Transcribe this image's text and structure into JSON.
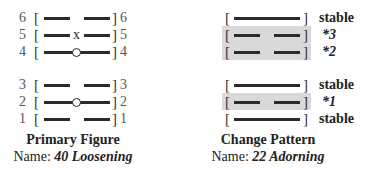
{
  "primary": {
    "rows": [
      {
        "num": "6",
        "type": "broken",
        "mark": ""
      },
      {
        "num": "5",
        "type": "broken",
        "mark": "x"
      },
      {
        "num": "4",
        "type": "solid",
        "mark": "o"
      },
      {
        "num": "3",
        "type": "broken",
        "mark": ""
      },
      {
        "num": "2",
        "type": "solid",
        "mark": "o"
      },
      {
        "num": "1",
        "type": "broken",
        "mark": ""
      }
    ],
    "title": "Primary Figure",
    "name_label": "Name:",
    "name_value": "40 Loosening"
  },
  "change": {
    "rows": [
      {
        "type": "solid",
        "label": "stable",
        "highlight": false
      },
      {
        "type": "broken",
        "label": "*3",
        "highlight": true
      },
      {
        "type": "broken",
        "label": "*2",
        "highlight": true
      },
      {
        "type": "solid",
        "label": "stable",
        "highlight": false
      },
      {
        "type": "broken",
        "label": "*1",
        "highlight": true
      },
      {
        "type": "solid",
        "label": "stable",
        "highlight": false
      }
    ],
    "title": "Change Pattern",
    "name_label": "Name:",
    "name_value": "22 Adorning"
  },
  "glyphs": {
    "open": "[",
    "close": "]"
  }
}
